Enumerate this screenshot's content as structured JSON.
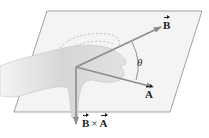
{
  "diagram": {
    "labels": {
      "vector_b": "B",
      "vector_a": "A",
      "cross_left": "B",
      "cross_op": "×",
      "cross_right": "A",
      "angle": "θ"
    },
    "colors": {
      "plane_fill": "#f3f3f3",
      "plane_edge": "#8a8a8a",
      "vector": "#8c8c8c",
      "hand": "#d9d9d9",
      "text": "#222222"
    }
  }
}
